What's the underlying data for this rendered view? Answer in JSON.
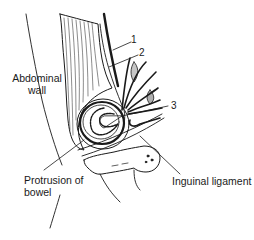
{
  "diagram": {
    "labels": {
      "abdominal_wall_line1": "Abdominal",
      "abdominal_wall_line2": "wall",
      "protrusion_line1": "Protrusion of",
      "protrusion_line2": "bowel",
      "inguinal_ligament": "Inguinal ligament"
    },
    "numbered_callouts": [
      "1",
      "2",
      "3"
    ],
    "colors": {
      "ink": "#1a1a1a",
      "background": "#ffffff"
    }
  }
}
